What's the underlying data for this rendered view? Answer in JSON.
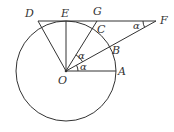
{
  "diagram": {
    "type": "geometry",
    "colors": {
      "line": "#333333",
      "background": "#ffffff"
    },
    "circle": {
      "center": "O",
      "cx": 66,
      "cy": 71,
      "r": 50
    },
    "points": {
      "O": {
        "label": "O",
        "x": 66,
        "y": 71
      },
      "A": {
        "label": "A",
        "x": 116,
        "y": 71
      },
      "B": {
        "label": "B",
        "x": 109.7,
        "y": 46.8
      },
      "C": {
        "label": "C",
        "x": 92.5,
        "y": 28.6
      },
      "D": {
        "label": "D",
        "x": 38,
        "y": 21
      },
      "E": {
        "label": "E",
        "x": 66,
        "y": 21
      },
      "G": {
        "label": "G",
        "x": 97,
        "y": 21
      },
      "F": {
        "label": "F",
        "x": 156,
        "y": 21
      }
    },
    "segments": [
      "OA",
      "OF",
      "OG",
      "OE",
      "OD",
      "DF"
    ],
    "angles": [
      {
        "at": "O",
        "between": "OA-OB",
        "label": "α"
      },
      {
        "at": "O",
        "between": "OB-OC",
        "label": "α"
      },
      {
        "at": "F",
        "between": "FD-FO",
        "label": "α"
      }
    ]
  },
  "labels": {
    "D": "D",
    "E": "E",
    "G": "G",
    "C": "C",
    "F": "F",
    "B": "B",
    "O": "O",
    "A": "A",
    "alpha_AOB": "α",
    "alpha_BOC": "α",
    "alpha_F": "α"
  }
}
